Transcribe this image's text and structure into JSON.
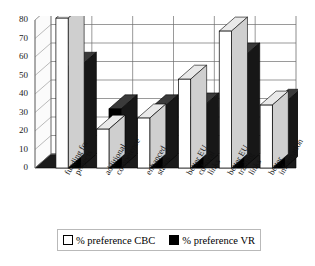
{
  "chart_data": {
    "type": "bar",
    "title": "",
    "xlabel": "",
    "ylabel": "",
    "ylim": [
      0,
      80
    ],
    "ytick_step": 10,
    "yticks": [
      "80",
      "70",
      "60",
      "50",
      "40",
      "30",
      "20",
      "10",
      "0"
    ],
    "grid": true,
    "legend_position": "bottom",
    "categories": [
      "funding for projects",
      "additional competence",
      "enhanced status",
      "better EU cultural links",
      "better EU trading links",
      "better information"
    ],
    "category_lines": [
      [
        "funding for",
        "projects"
      ],
      [
        "additional",
        "competence"
      ],
      [
        "enhanced",
        "status"
      ],
      [
        "better EU",
        "cultural",
        "links"
      ],
      [
        "better EU",
        "trading",
        "links"
      ],
      [
        "better",
        "information"
      ]
    ],
    "series": [
      {
        "name": "% preference CBC",
        "color": "#ffffff",
        "values": [
          81,
          21,
          27,
          48,
          74,
          34
        ]
      },
      {
        "name": "% preference VR",
        "color": "#000000",
        "values": [
          55,
          32,
          32,
          33,
          60,
          35
        ]
      }
    ]
  },
  "legend": {
    "items": [
      {
        "label": "% preference CBC",
        "swatch": "white-square-icon"
      },
      {
        "label": "% preference VR",
        "swatch": "black-square-icon"
      }
    ]
  },
  "axes": {
    "y_min_label": "0",
    "y_max_label": "80"
  }
}
